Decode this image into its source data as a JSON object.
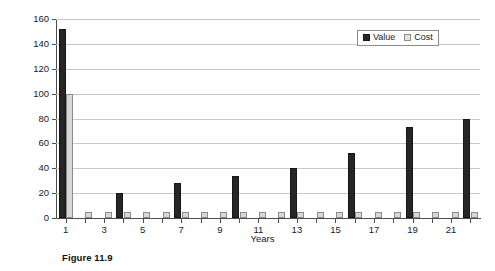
{
  "figure": {
    "caption": "Figure 11.9"
  },
  "legend": {
    "position": "top-right",
    "items": [
      {
        "label": "Value",
        "color": "#262626",
        "swatch": "value-swatch"
      },
      {
        "label": "Cost",
        "color": "#e4e4e4",
        "swatch": "cost-swatch"
      }
    ]
  },
  "chart_data": {
    "type": "bar",
    "title": "",
    "subtitle": "",
    "xlabel": "Years",
    "ylabel": "Dollars",
    "ylim": [
      0,
      160
    ],
    "ytick_step": 20,
    "yticks": [
      0,
      20,
      40,
      60,
      80,
      100,
      120,
      140,
      160
    ],
    "ytick_labels": [
      "0",
      "20",
      "40",
      "60",
      "80",
      "100",
      "120",
      "140",
      "160"
    ],
    "grid": "horizontal",
    "legend_position": "upper right",
    "categories": [
      1,
      2,
      3,
      4,
      5,
      6,
      7,
      8,
      9,
      10,
      11,
      12,
      13,
      14,
      15,
      16,
      17,
      18,
      19,
      20,
      21,
      22
    ],
    "xtick_labels": [
      "1",
      "3",
      "5",
      "7",
      "9",
      "11",
      "13",
      "15",
      "17",
      "19",
      "21"
    ],
    "xticks_shown": [
      1,
      3,
      5,
      7,
      9,
      11,
      13,
      15,
      17,
      19,
      21
    ],
    "series": [
      {
        "name": "Value",
        "color": "#262626",
        "values": [
          152,
          0,
          0,
          20,
          0,
          0,
          28,
          0,
          0,
          34,
          0,
          0,
          40,
          0,
          0,
          52,
          0,
          0,
          73,
          0,
          0,
          80
        ]
      },
      {
        "name": "Cost",
        "color": "#d8d8d8",
        "values": [
          100,
          5,
          5,
          5,
          5,
          5,
          5,
          5,
          5,
          5,
          5,
          5,
          5,
          5,
          5,
          5,
          5,
          5,
          5,
          5,
          5,
          5
        ]
      }
    ]
  }
}
